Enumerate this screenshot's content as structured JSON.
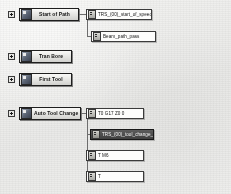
{
  "window": {
    "title": "Post Processor Path Tree"
  },
  "colors": {
    "background": "#ececea",
    "node_border": "#202020",
    "node_fill": "#e2e2df",
    "field_fill": "#fbfbfa",
    "selection": "#3f3f3f",
    "connector": "#6d6d6d"
  },
  "tree": {
    "groups": [
      {
        "id": "start-of-path",
        "label": "Start of Path",
        "icon": "block-icon",
        "expander": "expand-toggle",
        "expanded": true,
        "children": [
          {
            "id": "start-of-path-prog",
            "label": "TRS_(00)_start_of_speed",
            "icon": "field-icon",
            "selected": false
          },
          {
            "id": "beam-path-pass",
            "label": "Beam_path_pass",
            "icon": "field-icon",
            "selected": false
          }
        ]
      },
      {
        "id": "tran-bore",
        "label": "Tran Bore",
        "icon": "block-icon",
        "expander": "expand-toggle",
        "expanded": false,
        "children": []
      },
      {
        "id": "first-tool",
        "label": "First Tool",
        "icon": "block-icon",
        "expander": "expand-toggle",
        "expanded": false,
        "children": []
      },
      {
        "id": "auto-tool-change",
        "label": "Auto Tool Change",
        "icon": "block-icon",
        "expander": "expand-toggle",
        "expanded": true,
        "children": [
          {
            "id": "atc-g17",
            "label": "T0 G17 Z0 0",
            "icon": "field-icon",
            "selected": false
          },
          {
            "id": "atc-tool-change",
            "label": "TRS_(00)_tool_change_frt",
            "icon": "field-icon",
            "selected": true
          },
          {
            "id": "atc-m6",
            "label": "T M6",
            "icon": "field-icon",
            "selected": false
          },
          {
            "id": "atc-t",
            "label": "T",
            "icon": "field-icon",
            "selected": false
          }
        ]
      }
    ]
  }
}
